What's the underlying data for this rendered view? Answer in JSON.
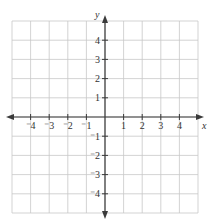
{
  "chart_data": {
    "type": "coordinate-grid",
    "title": "",
    "xlabel": "x",
    "ylabel": "y",
    "xlim": [
      -5,
      5
    ],
    "ylim": [
      -5,
      5
    ],
    "grid": true,
    "x_ticks": [
      -4,
      -3,
      -2,
      -1,
      1,
      2,
      3,
      4
    ],
    "y_ticks": [
      4,
      3,
      2,
      1,
      -1,
      -2,
      -3,
      -4
    ],
    "x_tick_labels": [
      "⁻4",
      "⁻3",
      "⁻2",
      "⁻1",
      "1",
      "2",
      "3",
      "4"
    ],
    "y_tick_labels": [
      "4",
      "3",
      "2",
      "1",
      "⁻1",
      "⁻2",
      "⁻3",
      "⁻4"
    ],
    "colors": {
      "grid": "#c8c8c8",
      "axis": "#3a3a3a",
      "text": "#333333"
    }
  }
}
